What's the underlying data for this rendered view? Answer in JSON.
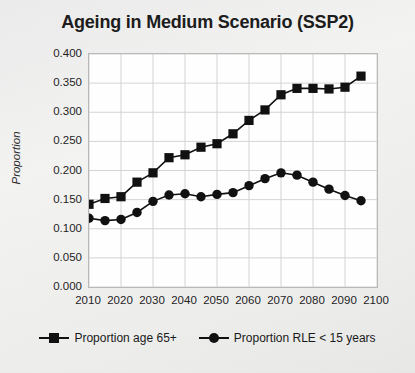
{
  "chart_data": {
    "type": "line",
    "title": "Ageing in Medium Scenario (SSP2)",
    "xlabel": "",
    "ylabel": "Proportion",
    "xlim": [
      2010,
      2100
    ],
    "ylim": [
      0.0,
      0.4
    ],
    "grid": true,
    "legend_position": "bottom",
    "xticks": [
      2010,
      2020,
      2030,
      2040,
      2050,
      2060,
      2070,
      2080,
      2090,
      2100
    ],
    "xtick_labels": [
      "2010",
      "2020",
      "2030",
      "2040",
      "2050",
      "2060",
      "2070",
      "2080",
      "2090",
      "2100"
    ],
    "yticks": [
      0.0,
      0.05,
      0.1,
      0.15,
      0.2,
      0.25,
      0.3,
      0.35,
      0.4
    ],
    "ytick_labels": [
      "0.000",
      "0.050",
      "0.100",
      "0.150",
      "0.200",
      "0.250",
      "0.300",
      "0.350",
      "0.400"
    ],
    "x": [
      2010,
      2015,
      2020,
      2025,
      2030,
      2035,
      2040,
      2045,
      2050,
      2055,
      2060,
      2065,
      2070,
      2075,
      2080,
      2085,
      2090,
      2095
    ],
    "series": [
      {
        "name": "Proportion age 65+",
        "marker": "square",
        "color": "#111111",
        "values": [
          0.142,
          0.152,
          0.155,
          0.18,
          0.196,
          0.222,
          0.227,
          0.24,
          0.246,
          0.263,
          0.286,
          0.304,
          0.33,
          0.341,
          0.341,
          0.34,
          0.343,
          0.341
        ]
      },
      {
        "name": "Proportion RLE < 15 years",
        "marker": "circle",
        "color": "#111111",
        "values": [
          0.118,
          0.114,
          0.116,
          0.128,
          0.147,
          0.158,
          0.16,
          0.155,
          0.159,
          0.162,
          0.174,
          0.186,
          0.196,
          0.192,
          0.18,
          0.168,
          0.157,
          0.148
        ]
      }
    ],
    "series_tail": [
      {
        "x": 2095,
        "square": 0.362,
        "circle": 0.148
      }
    ]
  },
  "legend": {
    "entries": [
      {
        "label": "Proportion age 65+",
        "marker": "square"
      },
      {
        "label": "Proportion RLE < 15 years",
        "marker": "circle"
      }
    ]
  }
}
